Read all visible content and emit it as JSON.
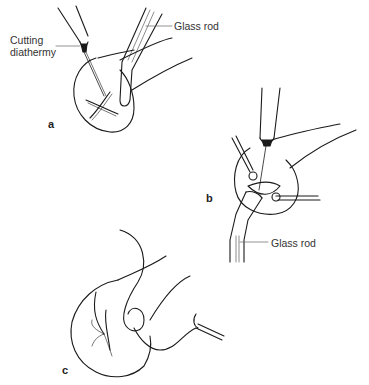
{
  "figure": {
    "panels": [
      {
        "id": "a",
        "label": "a"
      },
      {
        "id": "b",
        "label": "b"
      },
      {
        "id": "c",
        "label": "c"
      }
    ],
    "annotations": {
      "cutting_diathermy_line1": "Cutting",
      "cutting_diathermy_line2": "diathermy",
      "glass_rod_a": "Glass rod",
      "glass_rod_b": "Glass rod"
    },
    "colors": {
      "line": "#1a1a1a",
      "label_text": "#333333",
      "background": "#ffffff"
    }
  }
}
